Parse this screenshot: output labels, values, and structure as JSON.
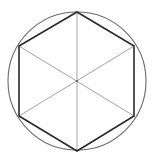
{
  "diagram": {
    "type": "geometry",
    "center": [
      77,
      81
    ],
    "circle_radius": 69,
    "hexagon_vertices": [
      [
        77,
        12
      ],
      [
        134,
        46
      ],
      [
        134,
        116
      ],
      [
        77,
        151
      ],
      [
        19,
        116
      ],
      [
        19,
        46
      ]
    ],
    "diagonals": [
      [
        [
          77,
          12
        ],
        [
          77,
          151
        ]
      ],
      [
        [
          19,
          46
        ],
        [
          134,
          116
        ]
      ],
      [
        [
          134,
          46
        ],
        [
          19,
          116
        ]
      ]
    ],
    "colors": {
      "background": "#ffffff",
      "circle": "#6a6a6a",
      "hexagon": "#2a2a2a",
      "diagonals": "#8a8a8a"
    }
  }
}
